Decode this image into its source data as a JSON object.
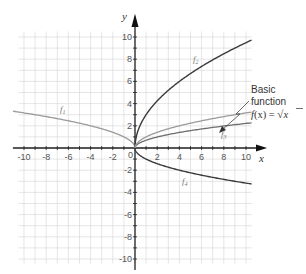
{
  "chart_data": {
    "type": "line",
    "title": "",
    "xlabel": "x",
    "ylabel": "y",
    "xlim": [
      -10,
      10
    ],
    "ylim": [
      -10,
      10
    ],
    "grid": true,
    "grid_step": 1,
    "x_ticks": [
      -10,
      -8,
      -6,
      -4,
      -2,
      0,
      2,
      4,
      6,
      8,
      10
    ],
    "y_ticks": [
      -10,
      -8,
      -6,
      -4,
      -2,
      2,
      4,
      6,
      8,
      10
    ],
    "origin_label": "0",
    "series": [
      {
        "name": "f1",
        "label": "f₁",
        "color": "#9a9a9a",
        "expression": "sqrt(-x)",
        "x": [
          -11,
          -9,
          -7,
          -5,
          -3,
          -1,
          0
        ],
        "y": [
          3.32,
          3.0,
          2.65,
          2.24,
          1.73,
          1.0,
          0
        ]
      },
      {
        "name": "f2",
        "label": "f₂",
        "color": "#3a3a3a",
        "expression": "3*sqrt(x)",
        "x": [
          0,
          1,
          2,
          4,
          6,
          8,
          10.5
        ],
        "y": [
          0,
          3.0,
          4.24,
          6.0,
          7.35,
          8.49,
          9.72
        ]
      },
      {
        "name": "f3",
        "label": "f₃",
        "color": "#6e6e6e",
        "expression": "0.7*sqrt(x)",
        "x": [
          0,
          1,
          2,
          4,
          6,
          8,
          10.5
        ],
        "y": [
          0,
          0.7,
          0.99,
          1.4,
          1.71,
          1.98,
          2.27
        ]
      },
      {
        "name": "basic",
        "label": "f(x) = √x",
        "color": "#9a9a9a",
        "expression": "sqrt(x)",
        "x": [
          0,
          1,
          2,
          4,
          6,
          8,
          10.5
        ],
        "y": [
          0,
          1.0,
          1.41,
          2.0,
          2.45,
          2.83,
          3.24
        ]
      },
      {
        "name": "f4",
        "label": "f₄",
        "color": "#3a3a3a",
        "expression": "-sqrt(x)",
        "x": [
          0,
          1,
          2,
          4,
          6,
          8,
          10.5
        ],
        "y": [
          0,
          -1.0,
          -1.41,
          -2.0,
          -2.45,
          -2.83,
          -3.24
        ]
      }
    ],
    "annotations": [
      {
        "text": "Basic function",
        "formula": "f(x) = √x",
        "points_to": {
          "x": 7,
          "y": 2.65
        }
      }
    ]
  },
  "labels": {
    "x_axis": "x",
    "y_axis": "y",
    "origin": "0",
    "f1": "f",
    "f1_sub": "1",
    "f2": "f",
    "f2_sub": "2",
    "f3": "f",
    "f3_sub": "3",
    "f4": "f",
    "f4_sub": "4",
    "annot_line1": "Basic",
    "annot_line2": "function",
    "annot_formula_f": "f",
    "annot_formula_rest": "(x) = ",
    "annot_sqrt_arg": "x",
    "xticks": [
      "-10",
      "-8",
      "-6",
      "-4",
      "-2",
      "2",
      "4",
      "6",
      "8",
      "10"
    ],
    "yticks": [
      "10",
      "8",
      "6",
      "4",
      "2",
      "-2",
      "-4",
      "-6",
      "-8",
      "-10"
    ]
  }
}
